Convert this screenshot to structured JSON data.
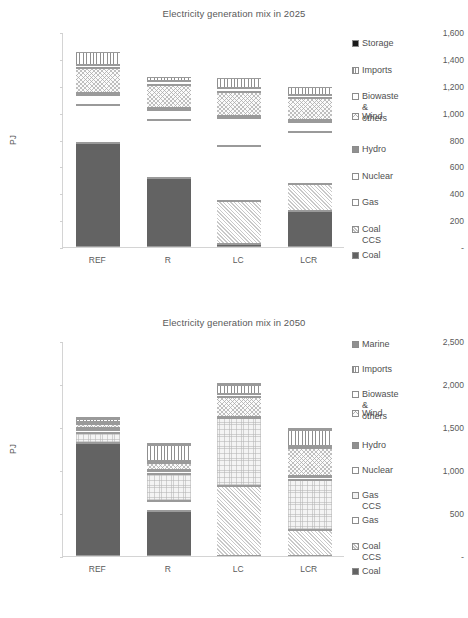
{
  "page": {
    "width": 468,
    "height": 618,
    "background": "#ffffff"
  },
  "charts": [
    {
      "id": "chart-2025",
      "title": "Electricity generation mix in 2025",
      "ylabel": "PJ",
      "ytick_labels": [
        "1,600",
        "1,400",
        "1,200",
        "1,000",
        "800",
        "600",
        "400",
        "200",
        "-"
      ],
      "categories": [
        "REF",
        "R",
        "LC",
        "LCR"
      ],
      "legend": [
        "Storage",
        "Imports",
        "Biowaste &\nothers",
        "Wind",
        "Hydro",
        "Nuclear",
        "Gas",
        "Coal CCS",
        "Coal"
      ],
      "chart_data": {
        "type": "bar",
        "subtype": "stacked-column",
        "title": "Electricity generation mix in 2025",
        "xlabel": "",
        "ylabel": "PJ",
        "ylim": [
          0,
          1600
        ],
        "yticks": [
          0,
          200,
          400,
          600,
          800,
          1000,
          1200,
          1400,
          1600
        ],
        "grid": false,
        "legend_position": "right",
        "categories": [
          "REF",
          "R",
          "LC",
          "LCR"
        ],
        "series": [
          {
            "name": "Coal",
            "values": [
              775,
              512,
              25,
              268
            ]
          },
          {
            "name": "Coal CCS",
            "values": [
              0,
              0,
              315,
              200
            ]
          },
          {
            "name": "Gas",
            "values": [
              280,
              430,
              415,
              390
            ]
          },
          {
            "name": "Nuclear",
            "values": [
              75,
              75,
              205,
              75
            ]
          },
          {
            "name": "Hydro",
            "values": [
              15,
              15,
              15,
              15
            ]
          },
          {
            "name": "Wind",
            "values": [
              185,
              175,
              180,
              160
            ]
          },
          {
            "name": "Biowaste & others",
            "values": [
              25,
              25,
              25,
              25
            ]
          },
          {
            "name": "Imports",
            "values": [
              95,
              35,
              80,
              55
            ]
          },
          {
            "name": "Storage",
            "values": [
              0,
              0,
              0,
              0
            ]
          }
        ],
        "totals": [
          1450,
          1272,
          1375,
          1188
        ]
      }
    },
    {
      "id": "chart-2050",
      "title": "Electricity generation mix in 2050",
      "ylabel": "PJ",
      "ytick_labels": [
        "2,500",
        "2,000",
        "1,500",
        "1,000",
        "500",
        "-"
      ],
      "categories": [
        "REF",
        "R",
        "LC",
        "LCR"
      ],
      "legend": [
        "Marine",
        "Imports",
        "Biowaste &\nothers",
        "Wind",
        "Hydro",
        "Nuclear",
        "Gas CCS",
        "Gas",
        "Coal CCS",
        "Coal"
      ],
      "chart_data": {
        "type": "bar",
        "subtype": "stacked-column",
        "title": "Electricity generation mix in 2050",
        "xlabel": "",
        "ylabel": "PJ",
        "ylim": [
          0,
          2500
        ],
        "yticks": [
          0,
          500,
          1000,
          1500,
          2000,
          2500
        ],
        "grid": false,
        "legend_position": "right",
        "categories": [
          "REF",
          "R",
          "LC",
          "LCR"
        ],
        "series": [
          {
            "name": "Coal",
            "values": [
              1310,
              520,
              0,
              0
            ]
          },
          {
            "name": "Coal CCS",
            "values": [
              0,
              0,
              815,
              305
            ]
          },
          {
            "name": "Gas",
            "values": [
              0,
              125,
              0,
              0
            ]
          },
          {
            "name": "Gas CCS",
            "values": [
              125,
              305,
              785,
              580
            ]
          },
          {
            "name": "Nuclear",
            "values": [
              35,
              35,
              0,
              30
            ]
          },
          {
            "name": "Hydro",
            "values": [
              20,
              20,
              20,
              20
            ]
          },
          {
            "name": "Wind",
            "values": [
              45,
              80,
              230,
              320
            ]
          },
          {
            "name": "Biowaste & others",
            "values": [
              20,
              25,
              30,
              25
            ]
          },
          {
            "name": "Imports",
            "values": [
              35,
              180,
              110,
              180
            ]
          },
          {
            "name": "Marine",
            "values": [
              20,
              20,
              20,
              25
            ]
          }
        ],
        "totals": [
          1590,
          1290,
          2000,
          1480
        ]
      }
    }
  ],
  "styles": {
    "patterns": {
      "Coal": "solid-dark",
      "Coal CCS": "diagonal-hatch-light",
      "Gas": "white-plain",
      "Gas CCS": "fine-dot-light",
      "Nuclear": "white-plain",
      "Hydro": "solid-mid-grey",
      "Wind": "cross-hatch-light",
      "Biowaste & others": "white-plain",
      "Imports": "vertical-stripes",
      "Storage": "solid-black",
      "Marine": "solid-mid-grey"
    },
    "colors": {
      "coal": "#636363",
      "hydro": "#8e8e8e",
      "marine": "#9a9a9a",
      "storage": "#1a1a1a",
      "light": "#f2f2f2",
      "white": "#ffffff",
      "axis": "#d4d4d4",
      "text": "#4f4f4f"
    }
  }
}
